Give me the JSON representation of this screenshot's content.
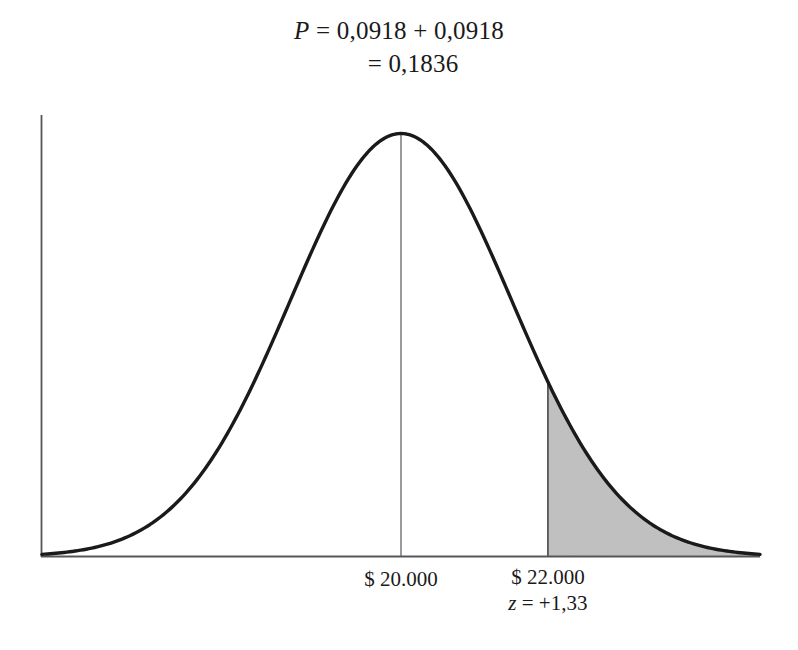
{
  "figure": {
    "title_formula": {
      "line1": "P = 0,0918 + 0,0918",
      "line1_symbol": "P",
      "line1_rest": " = 0,0918 + 0,0918",
      "line2": "= 0,1836"
    },
    "axis_labels": {
      "mean": "$ 20.000",
      "cutoff_value": "$ 22.000",
      "cutoff_z_symbol": "z",
      "cutoff_z_rest": " = +1,33",
      "cutoff_z": "z = +1,33"
    },
    "colors": {
      "curve": "#1a1a1a",
      "axis": "#55565a",
      "shading": "#c9c9c9",
      "center_line": "#6e7075",
      "background": "#ffffff"
    }
  },
  "chart_data": {
    "type": "area",
    "title": "P = 0,0918 + 0,0918 = 0,1836",
    "subtitle": "",
    "xlabel": "",
    "ylabel": "",
    "grid": false,
    "legend": null,
    "distribution": "normal",
    "mean_label": "$ 20.000",
    "mean_value": 20000,
    "std_dev_value": 1503.76,
    "cutoff_label": "$ 22.000",
    "cutoff_value": 22000,
    "cutoff_z": 1.33,
    "shaded_tail": "right",
    "shaded_area_probability": 0.0918,
    "total_probability": 0.1836,
    "probabilities": [
      0.0918,
      0.0918
    ],
    "x_ticks": [
      "$ 20.000",
      "$ 22.000"
    ],
    "x_tick_positions": [
      20000,
      22000
    ],
    "z_ticks": [
      "",
      "+1,33"
    ],
    "xlim": [
      15200,
      24800
    ],
    "ylim": [
      0,
      1
    ],
    "curve_points_z": [
      -3.2,
      -2.8,
      -2.4,
      -2.0,
      -1.6,
      -1.2,
      -0.8,
      -0.4,
      0.0,
      0.4,
      0.8,
      1.2,
      1.33,
      1.6,
      2.0,
      2.4,
      2.8,
      3.2
    ],
    "curve_points_density": [
      0.006,
      0.0198,
      0.0561,
      0.1353,
      0.278,
      0.4868,
      0.7261,
      0.9231,
      1.0,
      0.9231,
      0.7261,
      0.4868,
      0.4111,
      0.278,
      0.1353,
      0.0561,
      0.0198,
      0.006
    ]
  }
}
